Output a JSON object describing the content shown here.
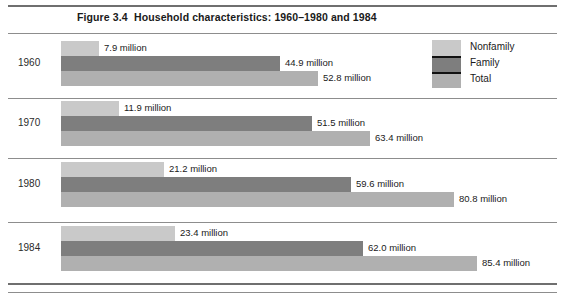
{
  "figure": {
    "number": "Figure 3.4",
    "title": "Household characteristics: 1960–1980 and 1984"
  },
  "legend": {
    "items": [
      {
        "label": "Nonfamily",
        "color": "#c9c9c9",
        "key": "nonfamily"
      },
      {
        "label": "Family",
        "color": "#7e7e7e",
        "key": "family"
      },
      {
        "label": "Total",
        "color": "#b0b0b0",
        "key": "total"
      }
    ]
  },
  "rows": [
    {
      "year": "1960",
      "bars": [
        {
          "series": "Nonfamily",
          "value": 7.9,
          "label": "7.9 million"
        },
        {
          "series": "Family",
          "value": 44.9,
          "label": "44.9 million"
        },
        {
          "series": "Total",
          "value": 52.8,
          "label": "52.8 million"
        }
      ]
    },
    {
      "year": "1970",
      "bars": [
        {
          "series": "Nonfamily",
          "value": 11.9,
          "label": "11.9 million"
        },
        {
          "series": "Family",
          "value": 51.5,
          "label": "51.5 million"
        },
        {
          "series": "Total",
          "value": 63.4,
          "label": "63.4 million"
        }
      ]
    },
    {
      "year": "1980",
      "bars": [
        {
          "series": "Nonfamily",
          "value": 21.2,
          "label": "21.2 million"
        },
        {
          "series": "Family",
          "value": 59.6,
          "label": "59.6 million"
        },
        {
          "series": "Total",
          "value": 80.8,
          "label": "80.8 million"
        }
      ]
    },
    {
      "year": "1984",
      "bars": [
        {
          "series": "Nonfamily",
          "value": 23.4,
          "label": "23.4  million"
        },
        {
          "series": "Family",
          "value": 62.0,
          "label": "62.0 million"
        },
        {
          "series": "Total",
          "value": 85.4,
          "label": "85.4 million"
        }
      ]
    }
  ],
  "chart_data": {
    "type": "bar",
    "orientation": "horizontal",
    "title": "Household characteristics: 1960–1980 and 1984",
    "subtitle": "Figure 3.4",
    "xlabel": "",
    "ylabel": "",
    "unit": "millions of households",
    "categories": [
      "1960",
      "1970",
      "1980",
      "1984"
    ],
    "series": [
      {
        "name": "Nonfamily",
        "color": "#c9c9c9",
        "values": [
          7.9,
          11.9,
          21.2,
          23.4
        ]
      },
      {
        "name": "Family",
        "color": "#7e7e7e",
        "values": [
          44.9,
          51.5,
          59.6,
          62.0
        ]
      },
      {
        "name": "Total",
        "color": "#b0b0b0",
        "values": [
          52.8,
          63.4,
          80.8,
          85.4
        ]
      }
    ],
    "data_labels": [
      [
        "7.9 million",
        "44.9 million",
        "52.8 million"
      ],
      [
        "11.9 million",
        "51.5 million",
        "63.4 million"
      ],
      [
        "21.2 million",
        "59.6 million",
        "80.8 million"
      ],
      [
        "23.4  million",
        "62.0 million",
        "85.4 million"
      ]
    ],
    "xlim": [
      0,
      85.4
    ],
    "grid": false,
    "legend_position": "top-right",
    "axes_visible": false,
    "px_per_unit": 4.87,
    "bar_origin_px": 61
  },
  "layout": {
    "row_tops": [
      41,
      101,
      162,
      226
    ],
    "bar_height": 15
  }
}
